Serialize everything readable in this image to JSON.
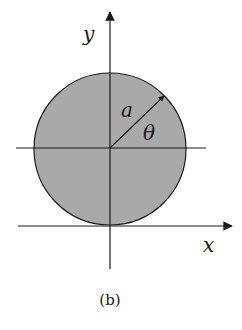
{
  "figure": {
    "caption": "(b)",
    "labels": {
      "y_axis": "y",
      "x_axis": "x",
      "radius": "a",
      "angle": "θ"
    },
    "colors": {
      "disk_fill": "#a9a9a9",
      "stroke": "#1a1a1a",
      "background": "#ffffff"
    },
    "geometry": {
      "circle_center": [
        110,
        148
      ],
      "circle_radius": 76,
      "x_axis_y": 226,
      "y_axis_x": 110
    }
  }
}
